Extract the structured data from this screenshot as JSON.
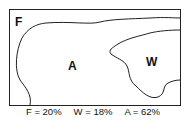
{
  "diagram": {
    "regions": [
      {
        "id": "F",
        "label": "F"
      },
      {
        "id": "A",
        "label": "A"
      },
      {
        "id": "W",
        "label": "W"
      }
    ],
    "caption": [
      {
        "text": "F = 20%"
      },
      {
        "text": "W = 18%"
      },
      {
        "text": "A = 62%"
      }
    ],
    "colors": {
      "line": "#222222",
      "background": "#ffffff"
    }
  }
}
